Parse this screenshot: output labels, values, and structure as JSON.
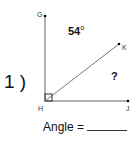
{
  "problem": {
    "number": "1 )",
    "points": {
      "G": "G",
      "H": "H",
      "J": "J",
      "K": "K"
    },
    "given_angle": "54",
    "degree_symbol": "o",
    "unknown": "?",
    "answer_label": "Angle =",
    "right_angle_at": "H"
  }
}
